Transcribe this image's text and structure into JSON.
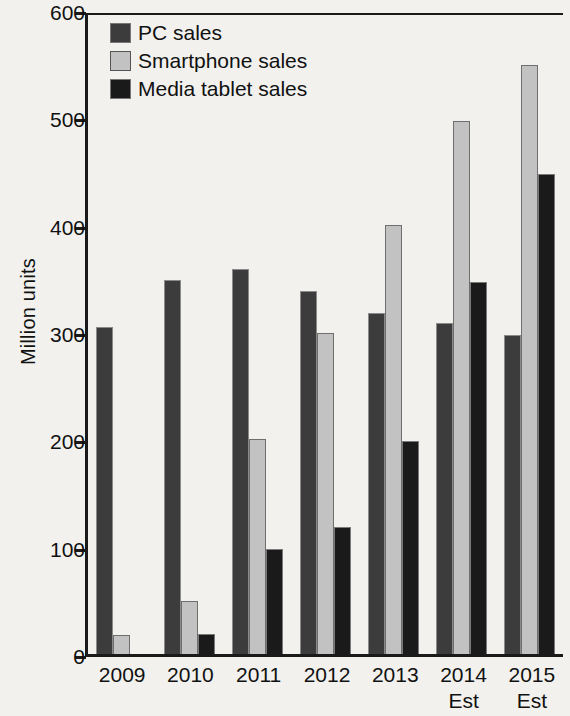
{
  "chart_data": {
    "type": "bar",
    "title": "",
    "xlabel": "",
    "ylabel": "Million units",
    "ylim": [
      0,
      600
    ],
    "yticks": [
      0,
      100,
      200,
      300,
      400,
      500,
      600
    ],
    "grid": false,
    "legend_position": "top-left",
    "categories": [
      "2009",
      "2010",
      "2011",
      "2012",
      "2013",
      "2014",
      "2015"
    ],
    "category_sublabels": [
      "",
      "",
      "",
      "",
      "",
      "Est",
      "Est"
    ],
    "series": [
      {
        "name": "PC sales",
        "color": "#3c3c3c",
        "values": [
          305,
          348,
          359,
          338,
          318,
          308,
          297
        ]
      },
      {
        "name": "Smartphone sales",
        "color": "#c2c2c2",
        "values": [
          18,
          49,
          200,
          299,
          400,
          497,
          549
        ]
      },
      {
        "name": "Media tablet sales",
        "color": "#1a1a1a",
        "values": [
          0,
          19,
          98,
          118,
          198,
          347,
          447
        ]
      }
    ]
  },
  "axis": {
    "y_title": "Million units",
    "y_tick_labels": [
      "600",
      "500",
      "400",
      "300",
      "200",
      "100",
      "0"
    ],
    "x_tick_labels": [
      "2009",
      "2010",
      "2011",
      "2012",
      "2013",
      "2014",
      "2015"
    ],
    "x_tick_sublabels": [
      "",
      "",
      "",
      "",
      "",
      "Est",
      "Est"
    ]
  },
  "legend": {
    "items": [
      {
        "label": "PC sales",
        "swatch": "#3c3c3c"
      },
      {
        "label": "Smartphone sales",
        "swatch": "#c2c2c2"
      },
      {
        "label": "Media tablet sales",
        "swatch": "#1a1a1a"
      }
    ]
  }
}
